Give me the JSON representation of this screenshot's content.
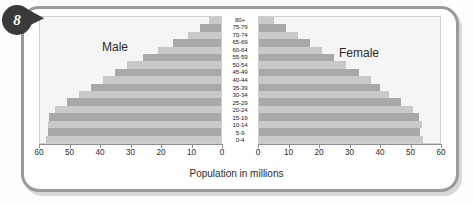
{
  "badge": {
    "number": "8"
  },
  "caption": "Population in millions",
  "panels": {
    "left_title": "Male",
    "right_title": "Female"
  },
  "axis": {
    "left_ticks": [
      "60",
      "50",
      "40",
      "30",
      "20",
      "10",
      "0"
    ],
    "right_ticks": [
      "0",
      "10",
      "20",
      "30",
      "40",
      "50",
      "60"
    ],
    "max": 60,
    "unit": "millions"
  },
  "chart_data": {
    "type": "bar",
    "title": "",
    "subtitle": "",
    "xlabel": "Population in millions",
    "ylabel": "",
    "xlim": [
      0,
      60
    ],
    "grid": false,
    "legend": [
      "Male",
      "Female"
    ],
    "legend_position": "inside-panels",
    "orientation": "horizontal-diverging",
    "categories": [
      "80+",
      "75-79",
      "70-74",
      "65-69",
      "60-64",
      "55-59",
      "50-54",
      "45-49",
      "40-44",
      "35-39",
      "30-34",
      "25-29",
      "20-24",
      "15-19",
      "10-14",
      "5-9",
      "0-4"
    ],
    "series": [
      {
        "name": "Male",
        "side": "left",
        "values": [
          4,
          7,
          11,
          16,
          21,
          26,
          31,
          35,
          39,
          43,
          47,
          51,
          55,
          57,
          57.5,
          57.5,
          58
        ]
      },
      {
        "name": "Female",
        "side": "right",
        "values": [
          5,
          9,
          13,
          17,
          21,
          25,
          29,
          33,
          37,
          40,
          43,
          47,
          51,
          53,
          54,
          53.5,
          54.5
        ]
      }
    ],
    "colors": {
      "band_dark": "#a8a8a8",
      "band_light": "#c9c9c9",
      "panel_bg": "#f5f5f5"
    }
  }
}
